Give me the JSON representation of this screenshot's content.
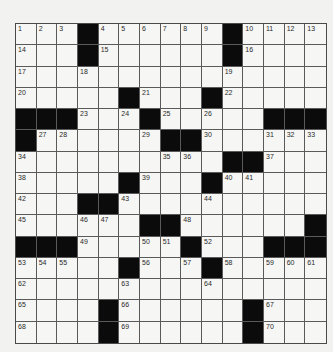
{
  "puzzle": {
    "size": {
      "rows": 15,
      "cols": 15
    },
    "colors": {
      "background": "#f2f2f0",
      "cell_white": "#f6f6f4",
      "cell_black": "#0b0b0b",
      "grid_line": "#5a5a5a",
      "number_text": "#2a2a2a"
    },
    "legend": {
      "black": -1,
      "white_unnumbered": 0,
      "numbered": "n>0"
    },
    "grid": [
      [
        1,
        2,
        3,
        -1,
        4,
        5,
        6,
        7,
        8,
        9,
        -1,
        10,
        11,
        12,
        13
      ],
      [
        14,
        0,
        0,
        -1,
        15,
        0,
        0,
        0,
        0,
        0,
        -1,
        16,
        0,
        0,
        0
      ],
      [
        17,
        0,
        0,
        18,
        0,
        0,
        0,
        0,
        0,
        0,
        19,
        0,
        0,
        0,
        0
      ],
      [
        20,
        0,
        0,
        0,
        0,
        -1,
        21,
        0,
        0,
        -1,
        22,
        0,
        0,
        0,
        0
      ],
      [
        -1,
        -1,
        -1,
        23,
        0,
        24,
        -1,
        25,
        0,
        26,
        0,
        0,
        -1,
        -1,
        -1
      ],
      [
        -1,
        27,
        28,
        0,
        0,
        0,
        29,
        -1,
        -1,
        30,
        0,
        0,
        31,
        32,
        33
      ],
      [
        34,
        0,
        0,
        0,
        0,
        0,
        0,
        35,
        36,
        0,
        -1,
        -1,
        37,
        0,
        0
      ],
      [
        38,
        0,
        0,
        0,
        0,
        -1,
        39,
        0,
        0,
        -1,
        40,
        41,
        0,
        0,
        0
      ],
      [
        42,
        0,
        0,
        -1,
        -1,
        43,
        0,
        0,
        0,
        44,
        0,
        0,
        0,
        0,
        0
      ],
      [
        45,
        0,
        0,
        46,
        47,
        0,
        -1,
        -1,
        48,
        0,
        0,
        0,
        0,
        0,
        -1
      ],
      [
        -1,
        -1,
        -1,
        49,
        0,
        0,
        50,
        51,
        -1,
        52,
        0,
        0,
        -1,
        -1,
        -1
      ],
      [
        53,
        54,
        55,
        0,
        0,
        -1,
        56,
        0,
        57,
        -1,
        58,
        0,
        59,
        60,
        61
      ],
      [
        62,
        0,
        0,
        0,
        0,
        63,
        0,
        0,
        0,
        64,
        0,
        0,
        0,
        0,
        0
      ],
      [
        65,
        0,
        0,
        0,
        -1,
        66,
        0,
        0,
        0,
        0,
        0,
        -1,
        67,
        0,
        0
      ],
      [
        68,
        0,
        0,
        0,
        -1,
        69,
        0,
        0,
        0,
        0,
        0,
        -1,
        70,
        0,
        0
      ]
    ],
    "entries": {}
  }
}
